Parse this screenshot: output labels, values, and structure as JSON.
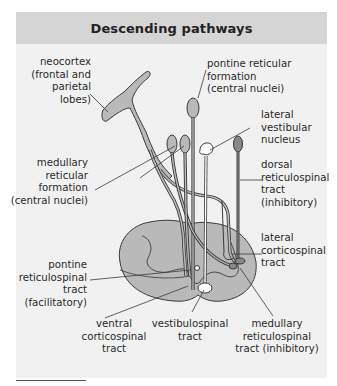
{
  "title": "Descending pathways",
  "colors": {
    "header_bg": "#d5d5d5",
    "panel_bg": "#f1f1f1",
    "structure_fill": "#b9b9b9",
    "outline": "#3a3a3a",
    "vestibular_fill": "#ffffff"
  },
  "labels": {
    "neocortex": "neocortex\n(frontal and\nparietal\nlobes)",
    "pontine_reticular_formation": "pontine reticular\nformation\n(central nuclei)",
    "lateral_vestibular_nucleus": "lateral\nvestibular\nnucleus",
    "medullary_reticular_formation": "medullary\nreticular\nformation\n(central nuclei)",
    "dorsal_reticulospinal_tract": "dorsal\nreticulospinal\ntract\n(inhibitory)",
    "lateral_corticospinal_tract": "lateral\ncorticospinal\ntract",
    "pontine_reticulospinal_tract": "pontine\nreticulospinal\ntract\n(facilitatory)",
    "ventral_corticospinal_tract": "ventral\ncorticospinal\ntract",
    "vestibulospinal_tract": "vestibulospinal\ntract",
    "medullary_reticulospinal_tract": "medullary\nreticulospinal\ntract (inhibitory)"
  }
}
